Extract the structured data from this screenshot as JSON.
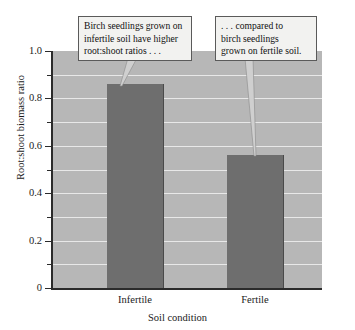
{
  "chart_data": {
    "type": "bar",
    "title": "",
    "subtitle": "",
    "xlabel": "Soil condition",
    "ylabel": "Root:shoot biomass ratio",
    "categories": [
      "Infertile",
      "Fertile"
    ],
    "values": [
      0.86,
      0.56
    ],
    "ylim": [
      0,
      1.0
    ],
    "y_major_ticks": [
      0,
      0.2,
      0.4,
      0.6,
      0.8,
      1.0
    ],
    "y_major_tick_labels": [
      "0",
      "0.2",
      "0.4",
      "0.6",
      "0.8",
      "1.0"
    ],
    "y_minor_ticks": [
      0.1,
      0.3,
      0.5,
      0.7,
      0.9
    ],
    "grid": "horizontal",
    "gridline_values": [
      0.1,
      0.2,
      0.3,
      0.4,
      0.5,
      0.6,
      0.7,
      0.8,
      0.9
    ],
    "legend": "none",
    "series": [
      {
        "name": "Root:shoot biomass ratio",
        "values": [
          0.86,
          0.56
        ]
      }
    ],
    "annotations": [
      {
        "id": "callout-infertile",
        "lines": [
          "Birch seedlings grown on",
          "infertile soil have higher",
          "root:shoot ratios . . ."
        ],
        "points_to": "Infertile"
      },
      {
        "id": "callout-fertile",
        "lines": [
          ". . . compared to",
          "birch seedlings",
          "grown on fertile soil."
        ],
        "points_to": "Fertile"
      }
    ],
    "colors": {
      "bar_fill": "#6e6e6e",
      "bar_edge": "#4a4a4a",
      "plot_background": "#b7b7b7",
      "gridline": "#e8e8e8",
      "axis": "#2b2b2b",
      "callout_background": "#f2f2f0",
      "callout_border": "#5a5a5a",
      "page_background": "#ffffff",
      "text": "#111111"
    }
  }
}
